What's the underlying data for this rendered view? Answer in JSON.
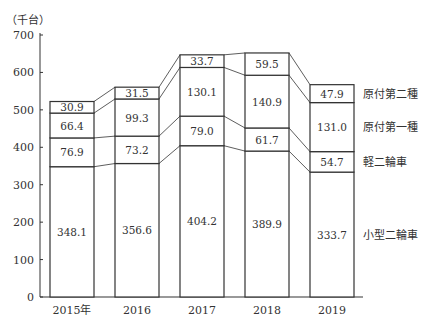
{
  "chart_data": {
    "type": "bar",
    "stacked": true,
    "title": "",
    "unit_label": "（千台）",
    "xlabel": "",
    "ylabel": "（千台）",
    "ylim": [
      0,
      700
    ],
    "yticks": [
      0,
      100,
      200,
      300,
      400,
      500,
      600,
      700
    ],
    "categories": [
      "2015年",
      "2016",
      "2017",
      "2018",
      "2019"
    ],
    "series": [
      {
        "name": "小型二輪車",
        "values": [
          348.1,
          356.6,
          404.2,
          389.9,
          333.7
        ]
      },
      {
        "name": "軽二輪車",
        "values": [
          76.9,
          73.2,
          79.0,
          61.7,
          54.7
        ]
      },
      {
        "name": "原付第一種",
        "values": [
          66.4,
          99.3,
          130.1,
          140.9,
          131.0
        ]
      },
      {
        "name": "原付第二種",
        "values": [
          30.9,
          31.5,
          33.7,
          59.5,
          47.9
        ]
      }
    ],
    "value_labels": [
      [
        "348.1",
        "356.6",
        "404.2",
        "389.9",
        "333.7"
      ],
      [
        "76.9",
        "73.2",
        "79.0",
        "61.7",
        "54.7"
      ],
      [
        "66.4",
        "99.3",
        "130.1",
        "140.9",
        "131.0"
      ],
      [
        "30.9",
        "31.5",
        "33.7",
        "59.5",
        "47.9"
      ]
    ],
    "legend_position": "right-inline",
    "grid": false
  }
}
